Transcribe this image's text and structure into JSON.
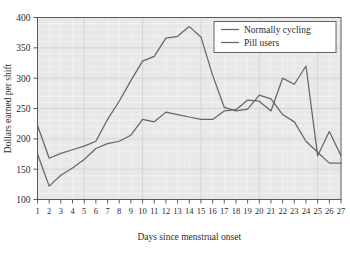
{
  "chart_data": {
    "type": "line",
    "title": "",
    "xlabel": "Days since menstrual onset",
    "ylabel": "Dollars earned per shift",
    "xlim": [
      1,
      27
    ],
    "ylim": [
      100,
      400
    ],
    "yticks": [
      100,
      150,
      200,
      250,
      300,
      350,
      400
    ],
    "grid": true,
    "legend_position": "top-right",
    "x": [
      1,
      2,
      3,
      4,
      5,
      6,
      7,
      8,
      9,
      10,
      11,
      12,
      13,
      14,
      15,
      16,
      17,
      18,
      19,
      20,
      21,
      22,
      23,
      24,
      25,
      26,
      27
    ],
    "categories": [
      "1",
      "2",
      "3",
      "4",
      "5",
      "6",
      "7",
      "8",
      "9",
      "10",
      "11",
      "12",
      "13",
      "14",
      "15",
      "16",
      "17",
      "18",
      "19",
      "20",
      "21",
      "22",
      "23",
      "24",
      "25",
      "26",
      "27"
    ],
    "series": [
      {
        "name": "Normally cycling",
        "values": [
          222,
          168,
          176,
          182,
          188,
          196,
          232,
          262,
          296,
          328,
          336,
          366,
          369,
          385,
          368,
          305,
          252,
          246,
          249,
          272,
          266,
          240,
          228,
          196,
          178,
          160,
          160
        ]
      },
      {
        "name": "Pill users",
        "values": [
          175,
          122,
          140,
          152,
          166,
          184,
          192,
          196,
          206,
          232,
          228,
          244,
          240,
          236,
          232,
          232,
          246,
          248,
          264,
          262,
          246,
          300,
          290,
          320,
          172,
          212,
          172
        ]
      }
    ],
    "legend_entries": [
      "Normally cycling",
      "Pill users"
    ],
    "colors": {
      "line": "#666666",
      "plot_background": "#e8e8e8",
      "grid_major": "#c9c9c9",
      "grid_minor": "#f4f4f4",
      "frame": "#5a5a5a",
      "text": "#2b2b2b"
    }
  }
}
